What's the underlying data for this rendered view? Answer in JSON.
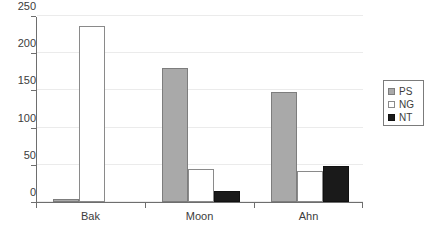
{
  "chart_data": {
    "type": "bar",
    "title": "",
    "subtitle": "",
    "xlabel": "",
    "ylabel": "",
    "categories": [
      "Bak",
      "Moon",
      "Ahn"
    ],
    "series": [
      {
        "name": "PS",
        "color": "#a9a9a9",
        "values": [
          4,
          180,
          148
        ]
      },
      {
        "name": "NG",
        "color": "#ffffff",
        "values": [
          236,
          45,
          42
        ]
      },
      {
        "name": "NT",
        "color": "#1a1a1a",
        "values": [
          0,
          15,
          48
        ]
      }
    ],
    "ylim": [
      0,
      250
    ],
    "yticks": [
      0,
      50,
      100,
      150,
      200,
      250
    ],
    "ytick_labels": [
      "0",
      "50",
      "100",
      "150",
      "200",
      "250"
    ],
    "grid": true,
    "legend_position": "right",
    "legend_entries": [
      "PS",
      "NG",
      "NT"
    ]
  },
  "axis_colors": {
    "axis_line": "#6e6e6e",
    "gridline": "#ebebeb",
    "text": "#3c3c3c"
  }
}
